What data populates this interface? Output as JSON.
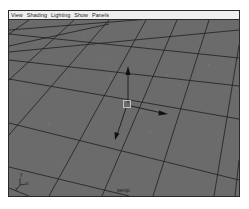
{
  "menubar": {
    "items": [
      {
        "label": "View"
      },
      {
        "label": "Shading"
      },
      {
        "label": "Lighting"
      },
      {
        "label": "Show"
      },
      {
        "label": "Panels"
      }
    ]
  },
  "viewport": {
    "camera_label": "persp",
    "background_color": "#6b6b6b",
    "grid_color": "#1f1f1f",
    "axis_indicator": {
      "y_label": "y",
      "z_label": "z",
      "x_label": "x"
    },
    "manipulator": {
      "type": "move-tool",
      "handles": [
        "y-axis",
        "x-axis",
        "z-axis",
        "center"
      ]
    }
  }
}
